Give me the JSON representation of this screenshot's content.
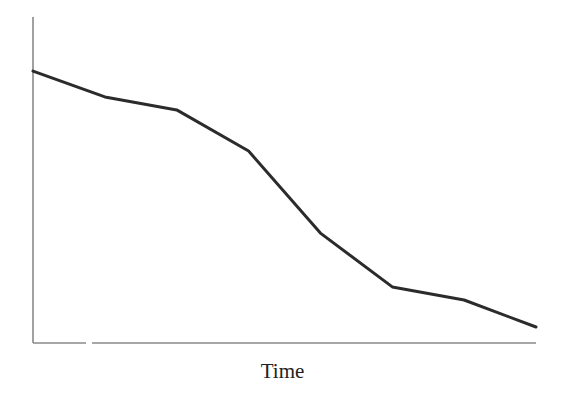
{
  "chart_data": {
    "type": "line",
    "title": "",
    "xlabel": "Time",
    "ylabel": "",
    "grid": false,
    "legend": null,
    "x": [
      1,
      2,
      3,
      4,
      5,
      6,
      7,
      8
    ],
    "series": [
      {
        "name": "value",
        "color": "#2b2b2b",
        "values": [
          83.4,
          75.5,
          71.5,
          58.9,
          33.7,
          17.2,
          13.2,
          4.9
        ]
      }
    ],
    "xlim": [
      1,
      8
    ],
    "ylim": [
      0,
      100
    ],
    "ticks": {
      "x": [],
      "y": []
    }
  },
  "colors": {
    "axis": "#8a8a8a",
    "line": "#2b2b2b",
    "background": "#ffffff"
  }
}
